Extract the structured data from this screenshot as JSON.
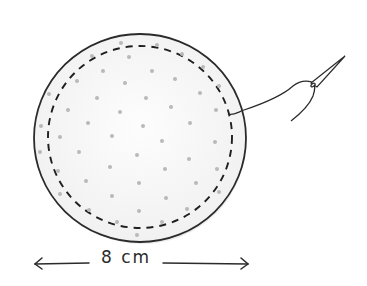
{
  "illustration": {
    "subject": "circle of fabric with running-stitch line, needle and thread",
    "dimension_label": "8 cm",
    "colors": {
      "outline": "#2b2b2b",
      "dots": "#bdbdbd",
      "fill": "#f7f7f7",
      "shadow": "#d9d9d9"
    }
  }
}
